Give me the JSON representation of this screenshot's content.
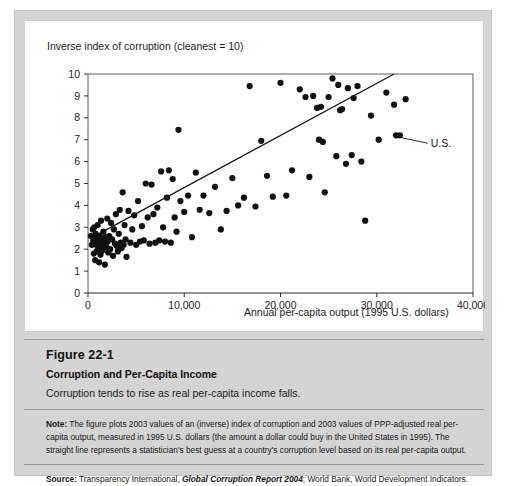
{
  "figure": {
    "number": "Figure 22-1",
    "title": "Corruption and Per-Capita Income",
    "subtitle": "Corruption tends to rise as real per-capita income falls.",
    "note_label": "Note:",
    "note_text_1": " The figure plots 2003 values of an (inverse) index of corruption and 2003 values of PPP-adjusted real per-capita output, measured in 1995 U.S. dollars (the amount a dollar could buy in the United States in 1995). The straight line represents a statistician's best guess at a country's corruption level based on its real per-capita output.",
    "source_label": "Source:",
    "source_text_pre": " Transparency International, ",
    "source_italic": "Global Corruption Report 2004",
    "source_text_post": "; World Bank, World Development Indicators."
  },
  "chart_data": {
    "type": "scatter",
    "title": "",
    "ylabel": "Inverse index of corruption (cleanest = 10)",
    "xlabel": "Annual per-capita output (1995 U.S. dollars)",
    "xlim": [
      0,
      40000
    ],
    "ylim": [
      0,
      10
    ],
    "xticks": [
      0,
      10000,
      20000,
      30000,
      40000
    ],
    "xticklabels": [
      "0",
      "10,000",
      "20,000",
      "30,000",
      "40,000"
    ],
    "yticks": [
      0,
      1,
      2,
      3,
      4,
      5,
      6,
      7,
      8,
      9,
      10
    ],
    "yticklabels": [
      "0",
      "1",
      "2",
      "3",
      "4",
      "5",
      "6",
      "7",
      "8",
      "9",
      "10"
    ],
    "grid": false,
    "legend": null,
    "marker_color": "#111111",
    "marker_size": 4,
    "annotations": [
      {
        "label": "U.S.",
        "point": [
          32000,
          7.2
        ],
        "text_x": 35600,
        "text_y": 6.7
      }
    ],
    "trendline": {
      "label": "best-guess regression line",
      "x": [
        200,
        31800
      ],
      "y": [
        2.48,
        10.0
      ],
      "color": "#111111"
    },
    "points": [
      [
        300,
        2.6
      ],
      [
        400,
        2.2
      ],
      [
        500,
        2.9
      ],
      [
        550,
        2.4
      ],
      [
        600,
        1.8
      ],
      [
        650,
        3.0
      ],
      [
        700,
        2.3
      ],
      [
        750,
        1.5
      ],
      [
        800,
        2.7
      ],
      [
        850,
        2.2
      ],
      [
        900,
        1.9
      ],
      [
        950,
        2.5
      ],
      [
        1000,
        3.1
      ],
      [
        1050,
        2.0
      ],
      [
        1100,
        2.35
      ],
      [
        1150,
        1.4
      ],
      [
        1200,
        2.6
      ],
      [
        1250,
        2.25
      ],
      [
        1300,
        1.75
      ],
      [
        1350,
        3.3
      ],
      [
        1400,
        2.15
      ],
      [
        1450,
        2.45
      ],
      [
        1500,
        1.95
      ],
      [
        1600,
        2.8
      ],
      [
        1700,
        2.3
      ],
      [
        1750,
        1.3
      ],
      [
        1800,
        2.55
      ],
      [
        1900,
        2.1
      ],
      [
        2000,
        3.4
      ],
      [
        2050,
        2.35
      ],
      [
        2100,
        1.85
      ],
      [
        2200,
        2.6
      ],
      [
        2300,
        2.0
      ],
      [
        2400,
        3.2
      ],
      [
        2500,
        2.45
      ],
      [
        2600,
        1.7
      ],
      [
        2700,
        2.9
      ],
      [
        2800,
        2.25
      ],
      [
        2900,
        3.6
      ],
      [
        3000,
        2.15
      ],
      [
        3100,
        1.9
      ],
      [
        3200,
        2.7
      ],
      [
        3300,
        3.8
      ],
      [
        3400,
        2.3
      ],
      [
        3500,
        2.05
      ],
      [
        3600,
        4.6
      ],
      [
        3700,
        2.2
      ],
      [
        3800,
        3.1
      ],
      [
        3900,
        2.45
      ],
      [
        4000,
        1.65
      ],
      [
        4200,
        3.75
      ],
      [
        4400,
        2.3
      ],
      [
        4600,
        2.9
      ],
      [
        4800,
        3.55
      ],
      [
        5000,
        2.2
      ],
      [
        5200,
        4.2
      ],
      [
        5400,
        2.35
      ],
      [
        5600,
        3.05
      ],
      [
        5800,
        2.4
      ],
      [
        6000,
        5.0
      ],
      [
        6200,
        3.45
      ],
      [
        6400,
        2.25
      ],
      [
        6600,
        4.95
      ],
      [
        6800,
        3.6
      ],
      [
        7000,
        2.3
      ],
      [
        7200,
        3.9
      ],
      [
        7400,
        2.4
      ],
      [
        7600,
        5.55
      ],
      [
        7800,
        3.0
      ],
      [
        8000,
        2.35
      ],
      [
        8200,
        4.35
      ],
      [
        8400,
        5.6
      ],
      [
        8600,
        2.3
      ],
      [
        8800,
        5.2
      ],
      [
        9000,
        3.45
      ],
      [
        9200,
        2.8
      ],
      [
        9400,
        7.45
      ],
      [
        9600,
        4.2
      ],
      [
        10000,
        3.7
      ],
      [
        10400,
        4.45
      ],
      [
        10800,
        2.55
      ],
      [
        11200,
        5.5
      ],
      [
        11600,
        3.8
      ],
      [
        12000,
        4.45
      ],
      [
        12600,
        3.65
      ],
      [
        13200,
        4.85
      ],
      [
        13800,
        2.9
      ],
      [
        14400,
        3.75
      ],
      [
        15000,
        5.25
      ],
      [
        15600,
        4.0
      ],
      [
        16200,
        4.35
      ],
      [
        16800,
        9.45
      ],
      [
        17400,
        3.95
      ],
      [
        18000,
        6.95
      ],
      [
        18600,
        5.35
      ],
      [
        19200,
        4.4
      ],
      [
        20000,
        9.6
      ],
      [
        20600,
        4.45
      ],
      [
        21200,
        5.6
      ],
      [
        22000,
        9.3
      ],
      [
        22600,
        8.95
      ],
      [
        23000,
        5.3
      ],
      [
        23400,
        9.0
      ],
      [
        23800,
        8.45
      ],
      [
        24000,
        7.0
      ],
      [
        24200,
        8.5
      ],
      [
        24400,
        6.9
      ],
      [
        24600,
        4.6
      ],
      [
        25000,
        8.95
      ],
      [
        25400,
        9.8
      ],
      [
        25800,
        6.25
      ],
      [
        26000,
        9.5
      ],
      [
        26200,
        8.35
      ],
      [
        26400,
        8.4
      ],
      [
        26800,
        5.9
      ],
      [
        27000,
        9.35
      ],
      [
        27400,
        6.3
      ],
      [
        27600,
        8.9
      ],
      [
        28000,
        9.45
      ],
      [
        28400,
        6.0
      ],
      [
        28800,
        3.3
      ],
      [
        29400,
        8.1
      ],
      [
        30200,
        7.0
      ],
      [
        31000,
        9.15
      ],
      [
        31800,
        8.6
      ],
      [
        32000,
        7.2
      ],
      [
        32400,
        7.2
      ],
      [
        33000,
        8.85
      ]
    ]
  }
}
